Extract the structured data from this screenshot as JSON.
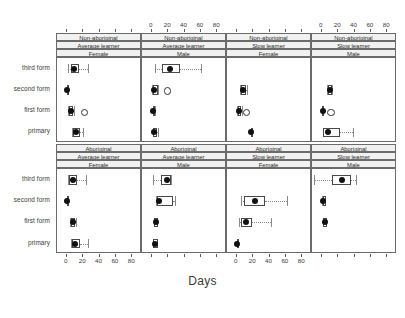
{
  "chart_data": {
    "type": "box",
    "title": "",
    "xlabel": "Days",
    "ylabel": "",
    "xlim": [
      -12,
      92
    ],
    "xticks": [
      0,
      20,
      40,
      60,
      80
    ],
    "xtick_labels": [
      "0",
      "20",
      "40",
      "60",
      "80"
    ],
    "categories": [
      "third form",
      "second form",
      "first form",
      "primary"
    ],
    "grid": false,
    "legend": "none",
    "strip_rows": [
      {
        "row": 0,
        "panels": [
          {
            "lines": [
              "Non-aboriginal",
              "Average learner",
              "Female"
            ]
          },
          {
            "lines": [
              "Non-aboriginal",
              "Average learner",
              "Male"
            ]
          },
          {
            "lines": [
              "Non-aboriginal",
              "Slow learner",
              "Female"
            ]
          },
          {
            "lines": [
              "Non-aboriginal",
              "Slow learner",
              "Male"
            ]
          }
        ]
      },
      {
        "row": 1,
        "panels": [
          {
            "lines": [
              "Aboriginal",
              "Average learner",
              "Female"
            ]
          },
          {
            "lines": [
              "Aboriginal",
              "Average learner",
              "Male"
            ]
          },
          {
            "lines": [
              "Aboriginal",
              "Slow learner",
              "Female"
            ]
          },
          {
            "lines": [
              "Aboriginal",
              "Slow learner",
              "Male"
            ]
          }
        ]
      }
    ],
    "panels": [
      {
        "id": "p1",
        "row": 0,
        "col": 0,
        "strip": [
          "Non-aboriginal",
          "Average learner",
          "Female"
        ],
        "axis_top": false,
        "axis_bottom": true,
        "boxes": [
          {
            "group": "third form",
            "lo": 2,
            "q1": 5,
            "med": 9,
            "q3": 15,
            "hi": 26,
            "outliers": []
          },
          {
            "group": "second form",
            "lo": 0,
            "q1": 0,
            "med": 0,
            "q3": 1,
            "hi": 2,
            "outliers": []
          },
          {
            "group": "first form",
            "lo": 2,
            "q1": 3,
            "med": 5,
            "q3": 8,
            "hi": 9,
            "outliers": [
              20
            ]
          },
          {
            "group": "primary",
            "lo": 6,
            "q1": 7,
            "med": 11,
            "q3": 16,
            "hi": 20,
            "outliers": []
          }
        ]
      },
      {
        "id": "p2",
        "row": 0,
        "col": 1,
        "strip": [
          "Non-aboriginal",
          "Average learner",
          "Male"
        ],
        "axis_top": true,
        "axis_bottom": false,
        "boxes": [
          {
            "group": "third form",
            "lo": 4,
            "q1": 12,
            "med": 22,
            "q3": 35,
            "hi": 60,
            "outliers": []
          },
          {
            "group": "second form",
            "lo": 0,
            "q1": 1,
            "med": 3,
            "q3": 7,
            "hi": 8,
            "outliers": [
              18
            ]
          },
          {
            "group": "first form",
            "lo": 1,
            "q1": 1,
            "med": 2,
            "q3": 3,
            "hi": 4,
            "outliers": []
          },
          {
            "group": "primary",
            "lo": 1,
            "q1": 1,
            "med": 3,
            "q3": 6,
            "hi": 7,
            "outliers": []
          }
        ]
      },
      {
        "id": "p3",
        "row": 0,
        "col": 2,
        "strip": [
          "Non-aboriginal",
          "Slow learner",
          "Female"
        ],
        "axis_top": false,
        "axis_bottom": true,
        "boxes": [
          {
            "group": "third form",
            "lo": null,
            "q1": null,
            "med": null,
            "q3": null,
            "hi": null,
            "outliers": []
          },
          {
            "group": "second form",
            "lo": 4,
            "q1": 5,
            "med": 7,
            "q3": 11,
            "hi": 12,
            "outliers": []
          },
          {
            "group": "first form",
            "lo": 0,
            "q1": 1,
            "med": 3,
            "q3": 5,
            "hi": 6,
            "outliers": [
              11
            ]
          },
          {
            "group": "primary",
            "lo": 17,
            "q1": 17,
            "med": 17,
            "q3": 17,
            "hi": 17,
            "outliers": []
          }
        ]
      },
      {
        "id": "p4",
        "row": 0,
        "col": 3,
        "strip": [
          "Non-aboriginal",
          "Slow learner",
          "Male"
        ],
        "axis_top": true,
        "axis_bottom": false,
        "boxes": [
          {
            "group": "third form",
            "lo": null,
            "q1": null,
            "med": null,
            "q3": null,
            "hi": null,
            "outliers": []
          },
          {
            "group": "second form",
            "lo": 6,
            "q1": 7,
            "med": 10,
            "q3": 12,
            "hi": 13,
            "outliers": []
          },
          {
            "group": "first form",
            "lo": 0,
            "q1": 0,
            "med": 1,
            "q3": 3,
            "hi": 3,
            "outliers": [
              10
            ]
          },
          {
            "group": "primary",
            "lo": 1,
            "q1": 2,
            "med": 7,
            "q3": 22,
            "hi": 38,
            "outliers": []
          }
        ]
      },
      {
        "id": "p5",
        "row": 1,
        "col": 0,
        "strip": [
          "Aboriginal",
          "Average learner",
          "Female"
        ],
        "axis_top": false,
        "axis_bottom": true,
        "boxes": [
          {
            "group": "third form",
            "lo": 2,
            "q1": 3,
            "med": 8,
            "q3": 13,
            "hi": 24,
            "outliers": []
          },
          {
            "group": "second form",
            "lo": 0,
            "q1": 0,
            "med": 0,
            "q3": 1,
            "hi": 2,
            "outliers": []
          },
          {
            "group": "first form",
            "lo": 4,
            "q1": 5,
            "med": 7,
            "q3": 10,
            "hi": 11,
            "outliers": []
          },
          {
            "group": "primary",
            "lo": 5,
            "q1": 6,
            "med": 10,
            "q3": 16,
            "hi": 26,
            "outliers": []
          }
        ]
      },
      {
        "id": "p6",
        "row": 1,
        "col": 1,
        "strip": [
          "Aboriginal",
          "Average learner",
          "Male"
        ],
        "axis_top": false,
        "axis_bottom": false,
        "boxes": [
          {
            "group": "third form",
            "lo": 2,
            "q1": 11,
            "med": 18,
            "q3": 23,
            "hi": 24,
            "outliers": []
          },
          {
            "group": "second form",
            "lo": 5,
            "q1": 6,
            "med": 9,
            "q3": 26,
            "hi": 28,
            "outliers": []
          },
          {
            "group": "first form",
            "lo": 3,
            "q1": 3,
            "med": 5,
            "q3": 7,
            "hi": 7,
            "outliers": []
          },
          {
            "group": "primary",
            "lo": 2,
            "q1": 2,
            "med": 4,
            "q3": 7,
            "hi": 7,
            "outliers": []
          }
        ]
      },
      {
        "id": "p7",
        "row": 1,
        "col": 2,
        "strip": [
          "Aboriginal",
          "Slow learner",
          "Female"
        ],
        "axis_top": false,
        "axis_bottom": true,
        "boxes": [
          {
            "group": "third form",
            "lo": null,
            "q1": null,
            "med": null,
            "q3": null,
            "hi": null,
            "outliers": []
          },
          {
            "group": "second form",
            "lo": 5,
            "q1": 9,
            "med": 22,
            "q3": 35,
            "hi": 62,
            "outliers": []
          },
          {
            "group": "first form",
            "lo": 3,
            "q1": 5,
            "med": 11,
            "q3": 18,
            "hi": 42,
            "outliers": []
          },
          {
            "group": "primary",
            "lo": 0,
            "q1": 0,
            "med": 0,
            "q3": 0,
            "hi": 0,
            "outliers": []
          }
        ]
      },
      {
        "id": "p8",
        "row": 1,
        "col": 3,
        "strip": [
          "Aboriginal",
          "Slow learner",
          "Male"
        ],
        "axis_top": false,
        "axis_bottom": false,
        "boxes": [
          {
            "group": "third form",
            "lo": -10,
            "q1": 13,
            "med": 25,
            "q3": 36,
            "hi": 42,
            "outliers": []
          },
          {
            "group": "second form",
            "lo": 0,
            "q1": 1,
            "med": 2,
            "q3": 5,
            "hi": 5,
            "outliers": []
          },
          {
            "group": "first form",
            "lo": 1,
            "q1": 2,
            "med": 4,
            "q3": 6,
            "hi": 6,
            "outliers": []
          },
          {
            "group": "primary",
            "lo": null,
            "q1": null,
            "med": null,
            "q3": null,
            "hi": null,
            "outliers": []
          }
        ]
      }
    ],
    "colors": {
      "median_dot": "#111111",
      "box_border": "#4a4a4a",
      "whisker": "#8a8a8a",
      "strip_bg": "#f1f1f1",
      "frame": "#6b6b6b",
      "text": "#3a3a3a"
    }
  }
}
